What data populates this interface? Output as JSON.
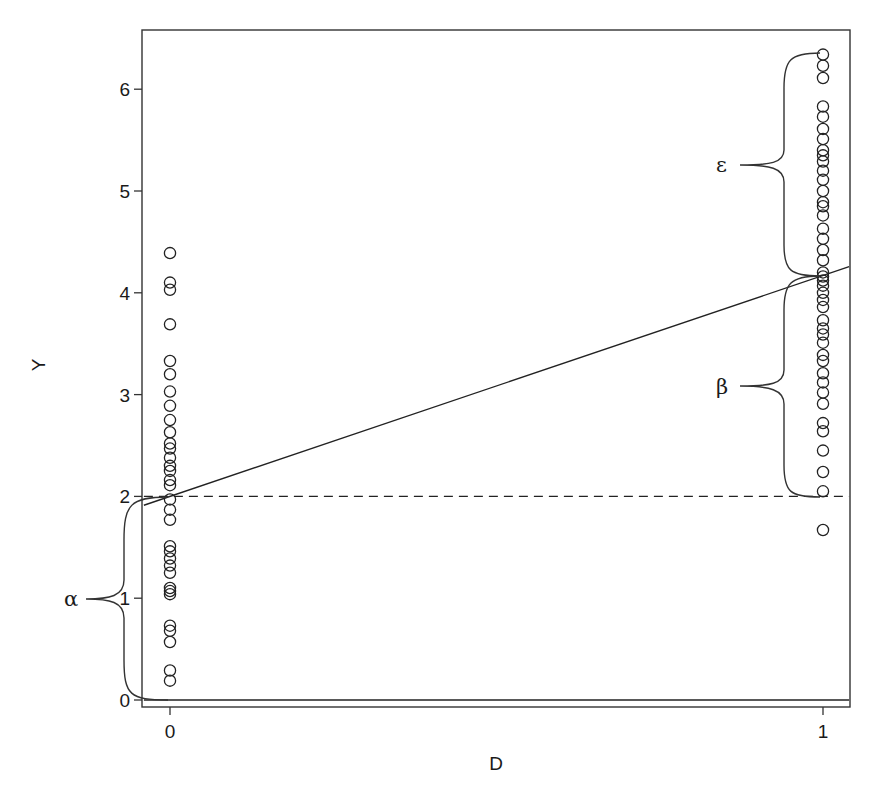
{
  "chart_data": {
    "type": "scatter",
    "title": "",
    "xlabel": "D",
    "ylabel": "Y",
    "xlim": [
      -0.04,
      1.04
    ],
    "ylim": [
      -0.07,
      6.57
    ],
    "x_ticks": [
      0,
      1
    ],
    "x_tick_labels": [
      "0",
      "1"
    ],
    "y_ticks": [
      0,
      1,
      2,
      3,
      4,
      5,
      6
    ],
    "y_tick_labels": [
      "0",
      "1",
      "2",
      "3",
      "4",
      "5",
      "6"
    ],
    "grid": false,
    "legend": null,
    "series": [
      {
        "name": "D=0",
        "x": 0,
        "marker": "open-circle",
        "values": [
          4.39,
          4.1,
          4.03,
          3.69,
          3.33,
          3.2,
          3.03,
          2.89,
          2.75,
          2.63,
          2.52,
          2.47,
          2.38,
          2.3,
          2.25,
          2.16,
          2.11,
          1.97,
          1.87,
          1.77,
          1.51,
          1.46,
          1.39,
          1.32,
          1.25,
          1.1,
          1.07,
          1.04,
          0.73,
          0.68,
          0.57,
          0.29,
          0.19
        ]
      },
      {
        "name": "D=1",
        "x": 1,
        "marker": "open-circle",
        "values": [
          6.34,
          6.23,
          6.11,
          5.83,
          5.73,
          5.61,
          5.51,
          5.4,
          5.35,
          5.29,
          5.2,
          5.11,
          5.0,
          4.89,
          4.85,
          4.76,
          4.63,
          4.53,
          4.42,
          4.32,
          4.2,
          4.16,
          4.12,
          4.07,
          4.0,
          3.93,
          3.86,
          3.73,
          3.65,
          3.59,
          3.51,
          3.39,
          3.33,
          3.21,
          3.12,
          3.02,
          2.91,
          2.72,
          2.64,
          2.45,
          2.24,
          2.05,
          1.67
        ]
      }
    ],
    "lines": [
      {
        "name": "regression-line",
        "style": "solid",
        "intercept": 2.0,
        "slope": 2.17,
        "x_range": [
          -0.04,
          1.04
        ]
      },
      {
        "name": "intercept-reference",
        "style": "dashed",
        "y": 2.0,
        "x_range": [
          -0.04,
          1.04
        ]
      },
      {
        "name": "zero-baseline",
        "style": "solid",
        "y": 0.0,
        "x_range": [
          -0.04,
          1.04
        ]
      }
    ],
    "annotations": [
      {
        "label": "α",
        "meaning": "brace from y=0 to y=2.0 at D=0",
        "y_from": 0.0,
        "y_to": 2.0,
        "side": "left"
      },
      {
        "label": "β",
        "meaning": "brace from y=2.0 to y=4.17 at D=1",
        "y_from": 2.0,
        "y_to": 4.17,
        "side": "left-of-D1"
      },
      {
        "label": "ε",
        "meaning": "brace from y=4.17 to top observation 6.34 at D=1",
        "y_from": 4.17,
        "y_to": 6.34,
        "side": "left-of-D1"
      }
    ]
  },
  "labels": {
    "xlabel": "D",
    "ylabel": "Y",
    "alpha": "α",
    "beta": "β",
    "epsilon": "ε",
    "x_ticks": [
      "0",
      "1"
    ],
    "y_ticks": [
      "0",
      "1",
      "2",
      "3",
      "4",
      "5",
      "6"
    ]
  }
}
